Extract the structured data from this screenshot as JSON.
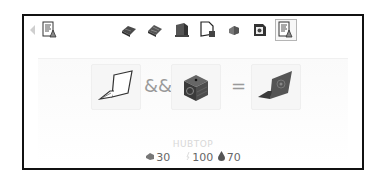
{
  "toolbar": {
    "back_icon": "back-arrow-icon",
    "left_icon": "recipe-book-icon",
    "items": [
      {
        "name": "green-circuit-board-icon"
      },
      {
        "name": "blue-circuit-board-icon"
      },
      {
        "name": "machine-frame-icon"
      },
      {
        "name": "document-with-block-icon"
      },
      {
        "name": "ore-chunk-icon"
      },
      {
        "name": "module-icon"
      },
      {
        "name": "recipe-book-icon",
        "selected": true
      }
    ]
  },
  "recipe": {
    "inputs": [
      {
        "name": "laptop",
        "icon": "laptop-outline-icon"
      },
      {
        "name": "hub",
        "icon": "hub-block-icon"
      }
    ],
    "combine_operator": "&&",
    "equals_operator": "=",
    "output": {
      "name": "hubtop",
      "icon": "hubtop-laptop-icon"
    }
  },
  "item": {
    "name": "HUBTOP",
    "stats": [
      {
        "icon": "ore-icon",
        "value": "30"
      },
      {
        "icon": "energy-icon",
        "value": "100"
      },
      {
        "icon": "drop-icon",
        "value": "70"
      }
    ]
  }
}
